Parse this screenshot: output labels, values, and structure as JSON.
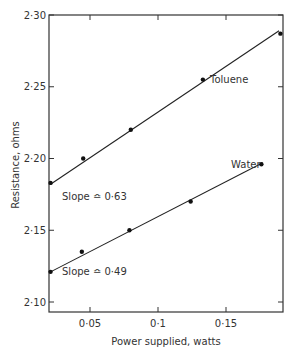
{
  "chart_data": {
    "type": "scatter",
    "title": "",
    "xlabel": "Power supplied, watts",
    "ylabel": "Resistance, ohms",
    "xlim": [
      0.017,
      0.19
    ],
    "ylim": [
      2.093,
      2.3
    ],
    "x_ticks": [
      0.05,
      0.1,
      0.15
    ],
    "x_tick_labels": [
      "0·05",
      "0·1",
      "0·15"
    ],
    "y_ticks": [
      2.1,
      2.15,
      2.2,
      2.25,
      2.3
    ],
    "y_tick_labels": [
      "2·10",
      "2·15",
      "2·20",
      "2·25",
      "2·30"
    ],
    "grid": false,
    "legend": "none (inline labels)",
    "series": [
      {
        "name": "Toluene",
        "points": [
          {
            "x": 0.021,
            "y": 2.183
          },
          {
            "x": 0.045,
            "y": 2.2
          },
          {
            "x": 0.08,
            "y": 2.22
          },
          {
            "x": 0.133,
            "y": 2.255
          },
          {
            "x": 0.19,
            "y": 2.287
          }
        ],
        "fit_line": {
          "x0": 0.021,
          "y0": 2.182,
          "x1": 0.189,
          "y1": 2.289
        },
        "slope_annotation": "Slope ≏ 0·63"
      },
      {
        "name": "Water",
        "points": [
          {
            "x": 0.021,
            "y": 2.121
          },
          {
            "x": 0.044,
            "y": 2.135
          },
          {
            "x": 0.079,
            "y": 2.15
          },
          {
            "x": 0.124,
            "y": 2.17
          },
          {
            "x": 0.176,
            "y": 2.196
          }
        ],
        "fit_line": {
          "x0": 0.021,
          "y0": 2.121,
          "x1": 0.177,
          "y1": 2.197
        },
        "slope_annotation": "Slope ≏ 0·49"
      }
    ],
    "annotations": [
      {
        "text": "Toluene",
        "x": 0.142,
        "y": 2.254
      },
      {
        "text": "Water",
        "x": 0.155,
        "y": 2.191
      },
      {
        "text": "Slope ≏ 0·63",
        "x": 0.035,
        "y": 2.174
      },
      {
        "text": "Slope ≏ 0·49",
        "x": 0.035,
        "y": 2.121
      }
    ]
  },
  "labels": {
    "xlabel": "Power supplied, watts",
    "ylabel": "Resistance, ohms",
    "toluene": "Toluene",
    "water": "Water",
    "slope_toluene": "Slope ≏ 0·63",
    "slope_water": "Slope ≏ 0·49"
  }
}
